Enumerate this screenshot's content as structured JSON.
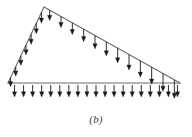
{
  "figure": {
    "caption": "(b)",
    "colors": {
      "outline": "#6b6b6b",
      "arrow": "#1a1a1a",
      "background": "#ffffff",
      "caption": "#3a3a3a"
    },
    "geometry": {
      "left_vertex": [
        8,
        83
      ],
      "top_vertex": [
        44,
        7
      ],
      "right_vertex": [
        180,
        83
      ],
      "outline_width": 1.1
    },
    "load_sets": [
      {
        "name": "left-slope-load",
        "edge": "left-slope",
        "from": [
          8,
          83
        ],
        "to": [
          44,
          7
        ],
        "count": 7,
        "arrow_length_min": 9,
        "arrow_length_max": 11,
        "direction": "down"
      },
      {
        "name": "hypotenuse-load",
        "edge": "hypotenuse",
        "from": [
          44,
          7
        ],
        "to": [
          180,
          83
        ],
        "count": 12,
        "arrow_length_min": 10,
        "arrow_length_max": 19,
        "direction": "down"
      },
      {
        "name": "base-load",
        "edge": "base",
        "from": [
          10,
          85
        ],
        "to": [
          182,
          85
        ],
        "count": 19,
        "arrow_length_min": 12,
        "arrow_length_max": 12,
        "direction": "down"
      }
    ]
  }
}
